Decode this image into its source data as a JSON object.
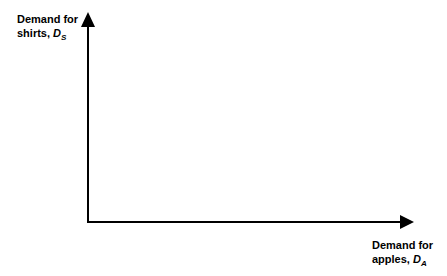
{
  "diagram": {
    "type": "axes",
    "y_axis": {
      "label_line1": "Demand for",
      "label_line2": "shirts, ",
      "symbol": "D",
      "subscript": "S"
    },
    "x_axis": {
      "label_line1": "Demand for",
      "label_line2": "apples, ",
      "symbol": "D",
      "subscript": "A"
    },
    "colors": {
      "axis": "#000000",
      "background": "#ffffff"
    }
  }
}
